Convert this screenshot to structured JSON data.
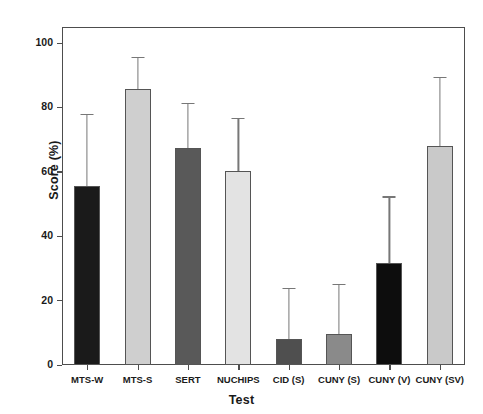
{
  "figure": {
    "top_clipped_text": "",
    "background_color": "#ffffff"
  },
  "chart_data": {
    "type": "bar",
    "title": "",
    "xlabel": "Test",
    "ylabel": "Score (%)",
    "categories": [
      "MTS-W",
      "MTS-S",
      "SERT",
      "NUCHIPS",
      "CID (S)",
      "CUNY (S)",
      "CUNY (V)",
      "CUNY (SV)"
    ],
    "values": [
      55.5,
      85.7,
      67.4,
      60.4,
      8.2,
      9.5,
      31.7,
      68.0
    ],
    "error_upper": [
      78.0,
      95.7,
      81.4,
      76.8,
      24.0,
      25.3,
      52.4,
      89.6
    ],
    "error_magnitude": [
      22.5,
      10.0,
      14.0,
      16.4,
      15.8,
      15.8,
      20.7,
      21.6
    ],
    "bar_colors": [
      "#1a1a1a",
      "#cfcfcf",
      "#595959",
      "#e3e3e3",
      "#4f4f4f",
      "#8a8a8a",
      "#0d0d0d",
      "#c9c9c9"
    ],
    "bar_edge_color": "#555555",
    "error_bar_color": "#777777",
    "ylim": [
      0,
      105
    ],
    "yticks": [
      0,
      20,
      40,
      60,
      80,
      100
    ],
    "ytick_labels": [
      "0",
      "20",
      "40",
      "60",
      "80",
      "100"
    ],
    "grid": false,
    "legend": null,
    "axis_color": "#4d4d4d"
  }
}
